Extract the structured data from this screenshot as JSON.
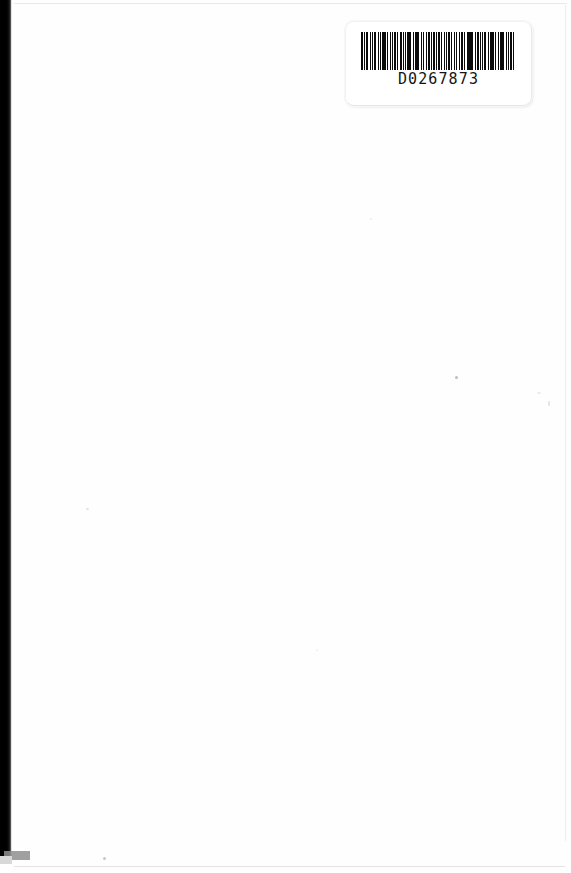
{
  "page": {
    "kind": "scanned-book-page",
    "background_color": "#ffffff",
    "paper_color": "#fefefe",
    "width": 571,
    "height": 873
  },
  "artifacts": {
    "gutter_label": "book-spine-gutter-shadow",
    "gutter_color": "#000000",
    "edge_line_color": "#e9e9e9",
    "speck_color": "#cfcfcf",
    "specks": [
      {
        "name": "dust-speck-center-right",
        "x": 455,
        "y": 376
      },
      {
        "name": "dust-speck-left-middle",
        "x": 86,
        "y": 508
      },
      {
        "name": "dust-speck-bottom-left",
        "x": 103,
        "y": 857
      },
      {
        "name": "dust-speck-upper-left",
        "x": 370,
        "y": 218
      },
      {
        "name": "dust-speck-right-margin",
        "x": 548,
        "y": 401
      },
      {
        "name": "dust-speck-lower-center",
        "x": 316,
        "y": 649
      },
      {
        "name": "dust-speck-right-edge",
        "x": 537,
        "y": 392
      }
    ]
  },
  "barcode_label": {
    "number": "D0267873",
    "symbology": "Code 39",
    "bar_color": "#0b0b0b",
    "label_background": "#ffffff",
    "position": {
      "x": 345,
      "y": 21,
      "width": 187,
      "height": 85
    },
    "bar_pattern": [
      3,
      2,
      1,
      2,
      3,
      2,
      1,
      3,
      1,
      2,
      3,
      2,
      1,
      2,
      1,
      3,
      2,
      1,
      3,
      1,
      1,
      3,
      2,
      2,
      1,
      2,
      3,
      1,
      2,
      2,
      3,
      2,
      1,
      3,
      1,
      2,
      2,
      1,
      3,
      2,
      1,
      2,
      3,
      1,
      2,
      3,
      1,
      2,
      2,
      3,
      1,
      2,
      3,
      2,
      1,
      1,
      3,
      2,
      2,
      1,
      3,
      1,
      2,
      3,
      1,
      2,
      2,
      1,
      3,
      2,
      1,
      3,
      2,
      1,
      2,
      3,
      1,
      2,
      3,
      1,
      2,
      2,
      3,
      1,
      2,
      1,
      3,
      2,
      1,
      3,
      2,
      2,
      1,
      3,
      1,
      2,
      3,
      2,
      1,
      2,
      3,
      1,
      2,
      2,
      1,
      3,
      2,
      1,
      3,
      1,
      2,
      3,
      2,
      1,
      2,
      1,
      3,
      2,
      1,
      3
    ]
  }
}
